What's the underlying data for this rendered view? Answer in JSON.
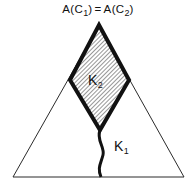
{
  "figure": {
    "title_text": "A(C₁) = A(C₂)",
    "title_parts": {
      "left_function": "A(C",
      "left_subscript": "1",
      "left_close": ")",
      "relation": "=",
      "right_function": "A(C",
      "right_subscript": "2",
      "right_close": ")"
    },
    "labels": {
      "k2_base": "K",
      "k2_subscript": "2",
      "k1_base": "K",
      "k1_subscript": "1"
    },
    "colors": {
      "background": "#ffffff",
      "outline": "#111111",
      "triangle_stroke": "#2b2b2b",
      "rhombus_stroke": "#111111",
      "hatch_stroke": "#4a4a4a",
      "hatch_fill": "#ffffff",
      "curve_stroke": "#111111"
    },
    "geometry": {
      "triangle": {
        "apex": [
          99,
          25
        ],
        "base_left": [
          13,
          177
        ],
        "base_right": [
          184,
          177
        ],
        "stroke_width": 1
      },
      "rhombus": {
        "top": [
          99,
          25
        ],
        "left": [
          70,
          80
        ],
        "bottom": [
          100,
          130
        ],
        "right": [
          129,
          80
        ],
        "stroke_width": 4,
        "hatch_angle_deg": 45,
        "hatch_spacing_px": 2
      },
      "curve_k1": {
        "start": [
          100,
          130
        ],
        "end": [
          101,
          177
        ],
        "stroke_width": 3,
        "shape": "s-curve"
      }
    }
  }
}
